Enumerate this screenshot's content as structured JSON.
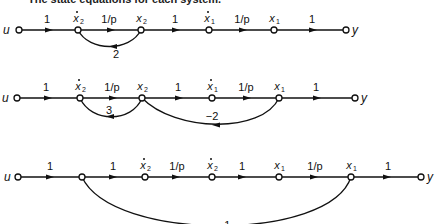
{
  "caption": "The state equations for each system.",
  "diagrams": [
    {
      "input": "u",
      "output": "y",
      "nodes": [
        {
          "var": "x",
          "sub": "2",
          "dot": true
        },
        {
          "var": "x",
          "sub": "2",
          "dot": false
        },
        {
          "var": "x",
          "sub": "1",
          "dot": true
        },
        {
          "var": "x",
          "sub": "1",
          "dot": false
        }
      ],
      "forward_gains": [
        "1",
        "1/p",
        "1",
        "1/p",
        "1"
      ],
      "feedback": [
        {
          "from": "x2",
          "to": "x2dot",
          "gain": "2"
        }
      ]
    },
    {
      "input": "u",
      "output": "y",
      "nodes": [
        {
          "var": "x",
          "sub": "2",
          "dot": true
        },
        {
          "var": "x",
          "sub": "2",
          "dot": false
        },
        {
          "var": "x",
          "sub": "1",
          "dot": true
        },
        {
          "var": "x",
          "sub": "1",
          "dot": false
        }
      ],
      "forward_gains": [
        "1",
        "1/p",
        "1",
        "1/p",
        "1"
      ],
      "feedback": [
        {
          "from": "x2",
          "to": "x2dot",
          "gain": "3"
        },
        {
          "from": "x1",
          "to": "x2",
          "gain": "−2"
        }
      ]
    },
    {
      "input": "u",
      "output": "y",
      "nodes": [
        {
          "var": "",
          "sub": "",
          "dot": false
        },
        {
          "var": "x",
          "sub": "2",
          "dot": true
        },
        {
          "var": "x",
          "sub": "2",
          "dot": true
        },
        {
          "var": "x",
          "sub": "1",
          "dot": false
        },
        {
          "var": "x",
          "sub": "1",
          "dot": false
        }
      ],
      "forward_gains": [
        "1",
        "1",
        "1/p",
        "1",
        "1/p",
        "1"
      ],
      "feedback": [
        {
          "from": "x1",
          "to": "node1",
          "gain": "−1"
        }
      ]
    }
  ]
}
